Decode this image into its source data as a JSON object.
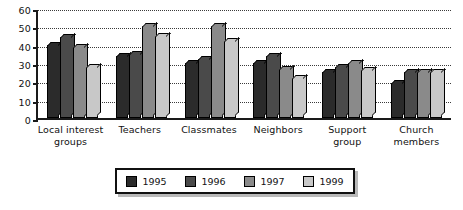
{
  "chart_data": {
    "type": "bar",
    "title": "",
    "xlabel": "",
    "ylabel": "",
    "ylim": [
      0,
      60
    ],
    "yticks": [
      0,
      10,
      20,
      30,
      40,
      50,
      60
    ],
    "grid": true,
    "legend_position": "bottom",
    "categories": [
      "Local interest groups",
      "Teachers",
      "Classmates",
      "Neighbors",
      "Support group",
      "Church members"
    ],
    "series": [
      {
        "name": "1995",
        "color": "#2b2b2b",
        "values": [
          40,
          34,
          30,
          30,
          25,
          19
        ]
      },
      {
        "name": "1996",
        "color": "#4a4a4a",
        "values": [
          44,
          35,
          32,
          34,
          28,
          25
        ]
      },
      {
        "name": "1997",
        "color": "#8a8a8a",
        "values": [
          39,
          50,
          50,
          27,
          30,
          25
        ]
      },
      {
        "name": "1999",
        "color": "#c8c8c8",
        "values": [
          28,
          45,
          42,
          22,
          26,
          25
        ]
      }
    ]
  },
  "legend": {
    "entries": [
      {
        "label": "1995",
        "color": "#2b2b2b"
      },
      {
        "label": "1996",
        "color": "#4a4a4a"
      },
      {
        "label": "1997",
        "color": "#8a8a8a"
      },
      {
        "label": "1999",
        "color": "#c8c8c8"
      }
    ]
  },
  "axis": {
    "tick_labels": [
      "0",
      "10",
      "20",
      "30",
      "40",
      "50",
      "60"
    ]
  }
}
